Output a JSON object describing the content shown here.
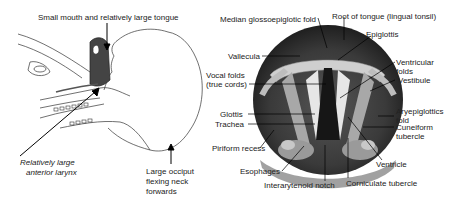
{
  "left_figure": {
    "name": "infant-head-profile",
    "labels": {
      "mouth_tongue": "Small mouth and relatively large tongue",
      "larynx_line1": "Relatively large",
      "larynx_line2": "anterior larynx",
      "occiput_line1": "Large occiput",
      "occiput_line2": "flexing neck",
      "occiput_line3": "forwards"
    }
  },
  "right_figure": {
    "name": "laryngoscopic-view",
    "labels": {
      "median_fold": "Median glossoepiglotic fold",
      "root_tongue": "Root of tongue (lingual tonsil)",
      "epiglottis": "Epiglottis",
      "vallecula": "Vallecula",
      "vocal_folds_1": "Vocal folds",
      "vocal_folds_2": "(true cords)",
      "ventricular_1": "Ventricular",
      "ventricular_2": "folds",
      "vestibule": "Vestibule",
      "aryepiglottic_1": "Aryepiglottics",
      "aryepiglottic_2": "fold",
      "cuneiform_1": "Cuneiform",
      "cuneiform_2": "tubercle",
      "glottis": "Glottis",
      "trachea": "Trachea",
      "piriform": "Piriform recess",
      "ventricle": "Ventricle",
      "esophages": "Esophages",
      "corniculate": "Corniculate tubercle",
      "interarytenoid": "Interarytenoid notch"
    }
  },
  "colors": {
    "line": "#222222",
    "scope_dark": "#2a2a2a",
    "scope_mid": "#7a7a7a",
    "scope_light": "#d8d8d8"
  }
}
